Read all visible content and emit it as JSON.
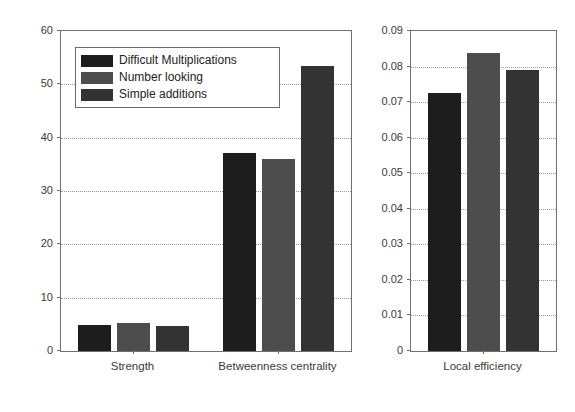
{
  "figure": {
    "background": "#ffffff",
    "axis_color": "#6f6f6f",
    "grid_color": "#9a9a9a"
  },
  "series_colors": {
    "difficult_multiplications": "#1d1d1d",
    "number_looking": "#4d4d4d",
    "simple_additions": "#333333"
  },
  "legend": {
    "position": "upper-left-of-left-panel",
    "entries": [
      {
        "label": "Difficult Multiplications",
        "color": "#1d1d1d"
      },
      {
        "label": "Number looking",
        "color": "#4d4d4d"
      },
      {
        "label": "Simple additions",
        "color": "#333333"
      }
    ]
  },
  "chart_data": [
    {
      "type": "bar",
      "id": "left-panel",
      "title": "",
      "xlabel": "",
      "ylabel": "",
      "categories": [
        "Strength",
        "Betweenness centrality"
      ],
      "series": [
        {
          "name": "Difficult Multiplications",
          "color": "#1d1d1d",
          "values": [
            4.9,
            37.2
          ]
        },
        {
          "name": "Number looking",
          "color": "#4d4d4d",
          "values": [
            5.2,
            36.0
          ]
        },
        {
          "name": "Simple additions",
          "color": "#333333",
          "values": [
            4.7,
            53.5
          ]
        }
      ],
      "ylim": [
        0,
        60
      ],
      "yticks": [
        0,
        10,
        20,
        30,
        40,
        50,
        60
      ],
      "ytick_labels": [
        "0",
        "10",
        "20",
        "30",
        "40",
        "50",
        "60"
      ],
      "grid": true,
      "legend_position": "upper left"
    },
    {
      "type": "bar",
      "id": "right-panel",
      "title": "",
      "xlabel": "",
      "ylabel": "",
      "categories": [
        "Local efficiency"
      ],
      "series": [
        {
          "name": "Difficult Multiplications",
          "color": "#1d1d1d",
          "values": [
            0.0725
          ]
        },
        {
          "name": "Number looking",
          "color": "#4d4d4d",
          "values": [
            0.0838
          ]
        },
        {
          "name": "Simple additions",
          "color": "#333333",
          "values": [
            0.079
          ]
        }
      ],
      "ylim": [
        0,
        0.09
      ],
      "yticks": [
        0,
        0.01,
        0.02,
        0.03,
        0.04,
        0.05,
        0.06,
        0.07,
        0.08,
        0.09
      ],
      "ytick_labels": [
        "0",
        "0.01",
        "0.02",
        "0.03",
        "0.04",
        "0.05",
        "0.06",
        "0.07",
        "0.08",
        "0.09"
      ],
      "grid": true,
      "legend_position": "none"
    }
  ]
}
